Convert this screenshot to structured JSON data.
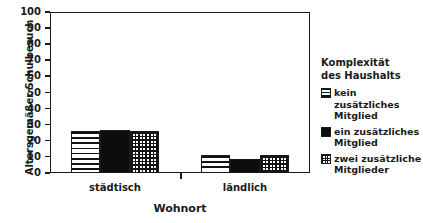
{
  "chart_data": {
    "type": "bar",
    "title": "",
    "xlabel": "Wohnort",
    "ylabel": "Altersgemäßer Schulbesuch",
    "categories": [
      "städtisch",
      "ländlich"
    ],
    "series": [
      {
        "name": "kein zusätzliches\nMitglied",
        "pattern": "horizontal-lines",
        "values": [
          26,
          11
        ]
      },
      {
        "name": "ein zusätzliches\nMitglied",
        "pattern": "solid-black",
        "values": [
          27,
          9
        ]
      },
      {
        "name": "zwei zusätzliche\nMitglieder",
        "pattern": "grid-crosshatch",
        "values": [
          26,
          11
        ]
      }
    ],
    "ylim": [
      0,
      100
    ],
    "yticks": [
      0,
      10,
      20,
      30,
      40,
      50,
      60,
      70,
      80,
      90,
      100
    ],
    "ytick_labels": [
      "0",
      "10",
      "20",
      "30",
      "40",
      "50",
      "60",
      "70",
      "80",
      "90",
      "100"
    ],
    "grid": false,
    "legend_position": "right",
    "legend_title": "Komplexität\ndes Haushalts",
    "colors": {
      "ink": "#1a1a1a",
      "fill": "#ffffff",
      "solid": "#0d0d0d"
    }
  },
  "legend": {
    "title_line1": "Komplexität",
    "title_line2": "des Haushalts",
    "entries": [
      {
        "label": "kein zusätzliches\nMitglied"
      },
      {
        "label": "ein zusätzliches\nMitglied"
      },
      {
        "label": "zwei zusätzliche\nMitglieder"
      }
    ]
  }
}
